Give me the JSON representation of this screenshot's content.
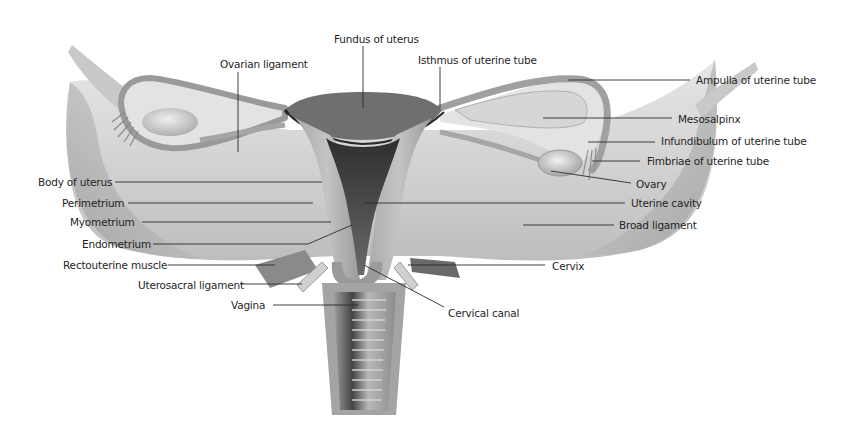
{
  "diagram": {
    "colors": {
      "background": "#ffffff",
      "tissue_light": "#d9d9d9",
      "tissue_mid": "#b5b5b5",
      "tissue_dark": "#6e6e6e",
      "cavity_dark": "#3a3a3a",
      "leader_line": "#2a2a2a",
      "label_text": "#1f1f1f"
    },
    "labels": {
      "fundus_of_uterus": "Fundus of uterus",
      "isthmus_of_uterine_tube": "Isthmus of uterine tube",
      "ovarian_ligament": "Ovarian ligament",
      "ampulla_of_uterine_tube": "Ampulla of uterine tube",
      "mesosalpinx": "Mesosalpinx",
      "infundibulum_of_uterine_tube": "Infundibulum of uterine tube",
      "fimbriae_of_uterine_tube": "Fimbriae of uterine tube",
      "ovary": "Ovary",
      "body_of_uterus": "Body of uterus",
      "perimetrium": "Perimetrium",
      "myometrium": "Myometrium",
      "endometrium": "Endometrium",
      "uterine_cavity": "Uterine cavity",
      "broad_ligament": "Broad ligament",
      "rectouterine_muscle": "Rectouterine muscle",
      "cervix": "Cervix",
      "uterosacral_ligament": "Uterosacral ligament",
      "vagina": "Vagina",
      "cervical_canal": "Cervical canal"
    }
  }
}
